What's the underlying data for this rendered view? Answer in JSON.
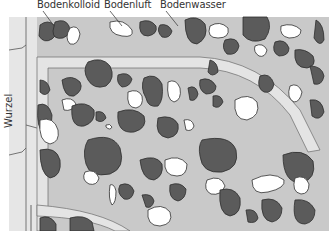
{
  "labels": {
    "colloid": "Bodenkolloid",
    "air": "Bodenluft",
    "water": "Bodenwasser",
    "root": "Wurzel"
  },
  "colors": {
    "background": "#ffffff",
    "water_film": "#c9c9c9",
    "root_area": "#e4e4e4",
    "colloid": "#5b5b5b",
    "air": "#ffffff",
    "outline": "#3a3a3a",
    "label_text": "#333333"
  }
}
